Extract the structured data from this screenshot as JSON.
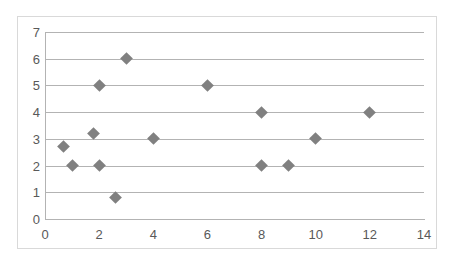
{
  "chart_data": {
    "type": "scatter",
    "title": "",
    "xlabel": "",
    "ylabel": "",
    "xlim": [
      0,
      14
    ],
    "ylim": [
      0,
      7
    ],
    "xticks": [
      0,
      2,
      4,
      6,
      8,
      10,
      12,
      14
    ],
    "yticks": [
      0,
      1,
      2,
      3,
      4,
      5,
      6,
      7
    ],
    "grid": "horizontal",
    "legend": "none",
    "marker": "diamond",
    "marker_color": "#808080",
    "gridline_color": "#b3b3b3",
    "axis_color": "#b3b3b3",
    "tick_label_color": "#595959",
    "background_color": "#ffffff",
    "frame_color": "#d9d9d9",
    "points": [
      {
        "x": 0.7,
        "y": 2.7
      },
      {
        "x": 1.0,
        "y": 2.0
      },
      {
        "x": 1.8,
        "y": 3.2
      },
      {
        "x": 2.0,
        "y": 5.0
      },
      {
        "x": 2.0,
        "y": 2.0
      },
      {
        "x": 2.6,
        "y": 0.8
      },
      {
        "x": 3.0,
        "y": 6.0
      },
      {
        "x": 4.0,
        "y": 3.0
      },
      {
        "x": 6.0,
        "y": 5.0
      },
      {
        "x": 8.0,
        "y": 4.0
      },
      {
        "x": 8.0,
        "y": 2.0
      },
      {
        "x": 9.0,
        "y": 2.0
      },
      {
        "x": 10.0,
        "y": 3.0
      },
      {
        "x": 12.0,
        "y": 4.0
      }
    ]
  }
}
